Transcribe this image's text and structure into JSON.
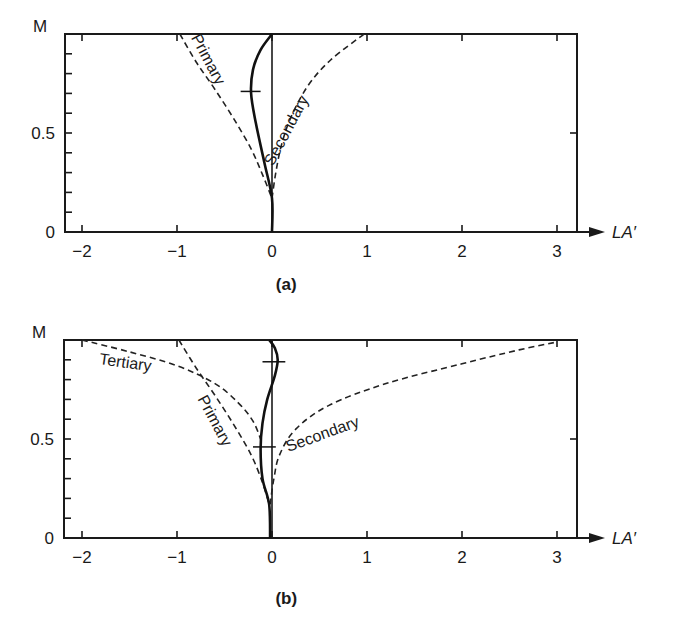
{
  "chart_data": [
    {
      "panel": "(a)",
      "type": "line",
      "xlabel": "LA′",
      "ylabel": "M",
      "xlim": [
        -2.2,
        3.2
      ],
      "ylim": [
        0,
        1
      ],
      "x_ticks": [
        -2,
        -1,
        0,
        1,
        2,
        3
      ],
      "x_tick_labels": [
        "−2",
        "−1",
        "0",
        "1",
        "2",
        "3"
      ],
      "y_ticks": [
        0,
        0.5
      ],
      "y_tick_labels": [
        "0",
        "0.5"
      ],
      "y_minor_ticks": [
        0.1,
        0.2,
        0.3,
        0.4,
        0.6,
        0.7,
        0.8,
        0.9
      ],
      "grid": false,
      "series": [
        {
          "name": "Primary",
          "style": "dashed",
          "points": [
            [
              -0.97,
              1.0
            ],
            [
              -0.8,
              0.86
            ],
            [
              -0.6,
              0.72
            ],
            [
              -0.4,
              0.57
            ],
            [
              -0.22,
              0.42
            ],
            [
              -0.1,
              0.29
            ],
            [
              0,
              0.17
            ]
          ]
        },
        {
          "name": "Secondary",
          "style": "dashed",
          "points": [
            [
              0,
              0.17
            ],
            [
              0.04,
              0.3
            ],
            [
              0.1,
              0.44
            ],
            [
              0.2,
              0.58
            ],
            [
              0.38,
              0.74
            ],
            [
              0.62,
              0.87
            ],
            [
              0.97,
              1.0
            ]
          ]
        },
        {
          "name": "Total",
          "style": "solid",
          "points": [
            [
              0,
              0
            ],
            [
              0,
              0.17
            ],
            [
              -0.08,
              0.35
            ],
            [
              -0.17,
              0.55
            ],
            [
              -0.22,
              0.7
            ],
            [
              -0.2,
              0.82
            ],
            [
              -0.12,
              0.92
            ],
            [
              0,
              1.0
            ]
          ]
        }
      ],
      "markers": [
        {
          "type": "crossbar",
          "M": 0.71,
          "x_from": -0.33,
          "x_to": -0.12
        }
      ],
      "annotations": [
        {
          "text": "Primary",
          "x": -0.72,
          "y": 0.86,
          "rotation": 62
        },
        {
          "text": "Secondary",
          "x": 0.2,
          "y": 0.5,
          "rotation": -62
        }
      ]
    },
    {
      "panel": "(b)",
      "type": "line",
      "xlabel": "LA′",
      "ylabel": "M",
      "xlim": [
        -2.2,
        3.2
      ],
      "ylim": [
        0,
        1
      ],
      "x_ticks": [
        -2,
        -1,
        0,
        1,
        2,
        3
      ],
      "x_tick_labels": [
        "−2",
        "−1",
        "0",
        "1",
        "2",
        "3"
      ],
      "y_ticks": [
        0,
        0.5
      ],
      "y_tick_labels": [
        "0",
        "0.5"
      ],
      "y_minor_ticks": [
        0.1,
        0.2,
        0.3,
        0.4,
        0.6,
        0.7,
        0.8,
        0.9
      ],
      "grid": false,
      "series": [
        {
          "name": "Tertiary",
          "style": "dashed",
          "points": [
            [
              -2.0,
              1.0
            ],
            [
              -1.5,
              0.94
            ],
            [
              -1.0,
              0.87
            ],
            [
              -0.6,
              0.78
            ],
            [
              -0.35,
              0.68
            ],
            [
              -0.2,
              0.59
            ],
            [
              -0.12,
              0.5
            ]
          ]
        },
        {
          "name": "Primary",
          "style": "dashed",
          "points": [
            [
              -0.98,
              1.0
            ],
            [
              -0.8,
              0.86
            ],
            [
              -0.6,
              0.72
            ],
            [
              -0.4,
              0.57
            ],
            [
              -0.22,
              0.42
            ],
            [
              -0.1,
              0.28
            ],
            [
              -0.03,
              0.17
            ]
          ]
        },
        {
          "name": "Secondary",
          "style": "dashed",
          "points": [
            [
              -0.02,
              0.17
            ],
            [
              0.02,
              0.3
            ],
            [
              0.08,
              0.42
            ],
            [
              0.25,
              0.55
            ],
            [
              0.6,
              0.67
            ],
            [
              1.2,
              0.78
            ],
            [
              2.0,
              0.88
            ],
            [
              2.6,
              0.95
            ],
            [
              3.0,
              0.99
            ]
          ]
        },
        {
          "name": "Total",
          "style": "solid",
          "points": [
            [
              -0.02,
              0
            ],
            [
              -0.03,
              0.17
            ],
            [
              -0.1,
              0.3
            ],
            [
              -0.12,
              0.45
            ],
            [
              -0.1,
              0.58
            ],
            [
              -0.05,
              0.7
            ],
            [
              0.03,
              0.82
            ],
            [
              0.06,
              0.9
            ],
            [
              0.03,
              0.96
            ],
            [
              -0.03,
              1.0
            ]
          ]
        }
      ],
      "markers": [
        {
          "type": "crossbar",
          "M": 0.89,
          "x_from": -0.1,
          "x_to": 0.14
        },
        {
          "type": "crossbar",
          "M": 0.46,
          "x_from": -0.2,
          "x_to": 0.04
        }
      ],
      "annotations": [
        {
          "text": "Tertiary",
          "x": -1.55,
          "y": 0.86,
          "rotation": 8
        },
        {
          "text": "Primary",
          "x": -0.65,
          "y": 0.58,
          "rotation": 62
        },
        {
          "text": "Secondary",
          "x": 0.55,
          "y": 0.5,
          "rotation": -20
        }
      ]
    }
  ],
  "labels": {
    "panel_a": "(a)",
    "panel_b": "(b)",
    "y_axis": "M",
    "x_axis": "LA′"
  }
}
